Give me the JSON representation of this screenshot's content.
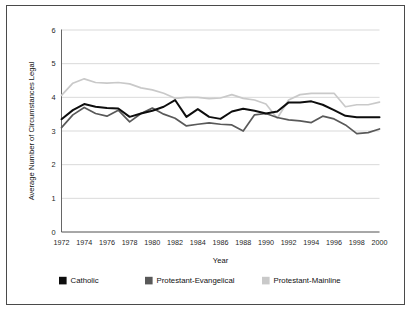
{
  "chart_data": {
    "type": "line",
    "title": "",
    "xlabel": "Year",
    "ylabel": "Average Number of Circumstances Legal",
    "xlim": [
      1972,
      2000
    ],
    "ylim": [
      0,
      6
    ],
    "yticks": [
      0,
      1,
      2,
      3,
      4,
      5,
      6
    ],
    "ytick_labels": [
      "0",
      "1",
      "2",
      "3",
      "4",
      "5",
      "6"
    ],
    "xticks": [
      1972,
      1974,
      1976,
      1978,
      1980,
      1982,
      1984,
      1986,
      1988,
      1990,
      1992,
      1994,
      1996,
      1998,
      2000
    ],
    "xtick_labels": [
      "1972",
      "1974",
      "1976",
      "1978",
      "1980",
      "1982",
      "1984",
      "1986",
      "1988",
      "1990",
      "1992",
      "1994",
      "1996",
      "1998",
      "2000"
    ],
    "grid": true,
    "grid_axis": "y",
    "legend_position": "below",
    "x": [
      1972,
      1973,
      1974,
      1975,
      1976,
      1977,
      1978,
      1979,
      1980,
      1981,
      1982,
      1983,
      1984,
      1985,
      1986,
      1987,
      1988,
      1989,
      1990,
      1991,
      1992,
      1993,
      1994,
      1995,
      1996,
      1997,
      1998,
      1999,
      2000
    ],
    "series": [
      {
        "name": "Catholic",
        "color": "#0d0d0d",
        "values": [
          3.35,
          3.62,
          3.8,
          3.72,
          3.68,
          3.67,
          3.42,
          3.52,
          3.6,
          3.72,
          3.92,
          3.42,
          3.65,
          3.42,
          3.36,
          3.58,
          3.66,
          3.6,
          3.52,
          3.58,
          3.85,
          3.85,
          3.88,
          3.78,
          3.62,
          3.45,
          3.41,
          3.41,
          3.41
        ]
      },
      {
        "name": "Protestant-Evangelical",
        "color": "#595959",
        "values": [
          3.1,
          3.48,
          3.7,
          3.52,
          3.44,
          3.62,
          3.27,
          3.52,
          3.68,
          3.5,
          3.38,
          3.15,
          3.2,
          3.24,
          3.2,
          3.18,
          3.0,
          3.48,
          3.52,
          3.4,
          3.33,
          3.3,
          3.25,
          3.44,
          3.36,
          3.18,
          2.92,
          2.95,
          3.06
        ]
      },
      {
        "name": "Protestant-Mainline",
        "color": "#c9c9c9",
        "values": [
          4.06,
          4.42,
          4.55,
          4.44,
          4.42,
          4.44,
          4.4,
          4.28,
          4.22,
          4.12,
          3.97,
          4.0,
          4.0,
          3.96,
          3.98,
          4.08,
          3.97,
          3.92,
          3.8,
          3.38,
          3.92,
          4.08,
          4.12,
          4.12,
          4.12,
          3.72,
          3.78,
          3.78,
          3.86
        ]
      }
    ]
  },
  "axes": {
    "ylabel": "Average Number of Circumstances Legal",
    "xlabel": "Year"
  },
  "legend": {
    "items": [
      {
        "label": "Catholic",
        "color": "#0d0d0d"
      },
      {
        "label": "Protestant-Evangelical",
        "color": "#595959"
      },
      {
        "label": "Protestant-Mainline",
        "color": "#c9c9c9"
      }
    ]
  }
}
